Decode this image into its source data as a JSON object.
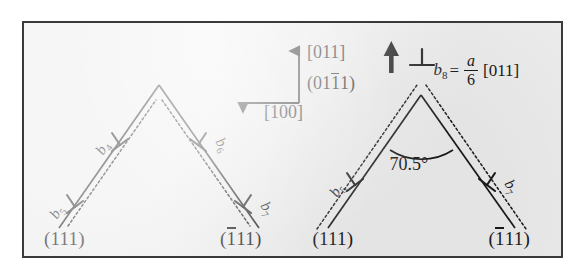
{
  "figure": {
    "background_color": "#ececec",
    "border_color": "#3a3a3a",
    "line_color": "#1a1a1a"
  },
  "axes": {
    "vertical_label": "[011]",
    "plane_label": "(01",
    "plane_label_overbar": "1",
    "plane_label_tail": "1)",
    "horizontal_label": "[100]",
    "vertical_arrow": "up-arrow-icon",
    "horizontal_arrow": "left-arrow-icon"
  },
  "panels": [
    {
      "id": "left",
      "name": "panel-left",
      "plane_left": "(111)",
      "plane_right_pre": "(",
      "plane_right_bar": "1",
      "plane_right_post": "11)",
      "burgers_vectors": [
        {
          "id": "b4",
          "label": "b",
          "sub": "4",
          "side": "left-upper"
        },
        {
          "id": "b5",
          "label": "b",
          "sub": "5",
          "side": "left-lower"
        },
        {
          "id": "b6",
          "label": "b",
          "sub": "6",
          "side": "right-upper"
        },
        {
          "id": "b7",
          "label": "b",
          "sub": "7",
          "side": "right-lower"
        }
      ]
    },
    {
      "id": "right",
      "name": "panel-right",
      "plane_left": "(111)",
      "plane_right_pre": "(",
      "plane_right_bar": "1",
      "plane_right_post": "11)",
      "angle": "70.5°",
      "burgers_vectors": [
        {
          "id": "b5r",
          "label": "b",
          "sub": "5",
          "side": "left"
        },
        {
          "id": "b7r",
          "label": "b",
          "sub": "7",
          "side": "right"
        }
      ],
      "equation": {
        "symbol": "b",
        "subscript": "8",
        "equals": "=",
        "numerator": "a",
        "denominator": "6",
        "direction": "[011]"
      },
      "apex_arrow": "bold-up-arrow-icon",
      "dislocation_symbol": "perpendicular-dislocation-icon"
    }
  ]
}
